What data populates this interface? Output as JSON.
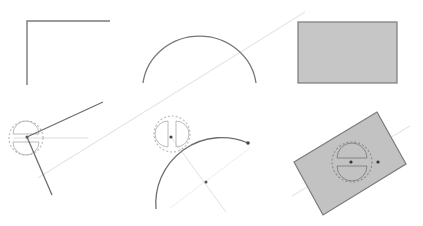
{
  "diagram": {
    "colors": {
      "background": "#ffffff",
      "stroke": "#777777",
      "rect_fill": "#c6c6c6",
      "rect_stroke": "#7a7a7a",
      "guide": "#e2e2e2",
      "gizmo": "#b5b5b5",
      "dot": "#444444"
    },
    "panels": [
      {
        "id": "corner-original",
        "shape": "polyline"
      },
      {
        "id": "arc-original",
        "shape": "arc"
      },
      {
        "id": "rect-original",
        "shape": "rectangle"
      },
      {
        "id": "corner-rotated",
        "shape": "polyline",
        "has_gizmo": true
      },
      {
        "id": "arc-rotated",
        "shape": "arc",
        "has_gizmo": true
      },
      {
        "id": "rect-rotated",
        "shape": "rectangle",
        "has_gizmo": true
      }
    ]
  }
}
